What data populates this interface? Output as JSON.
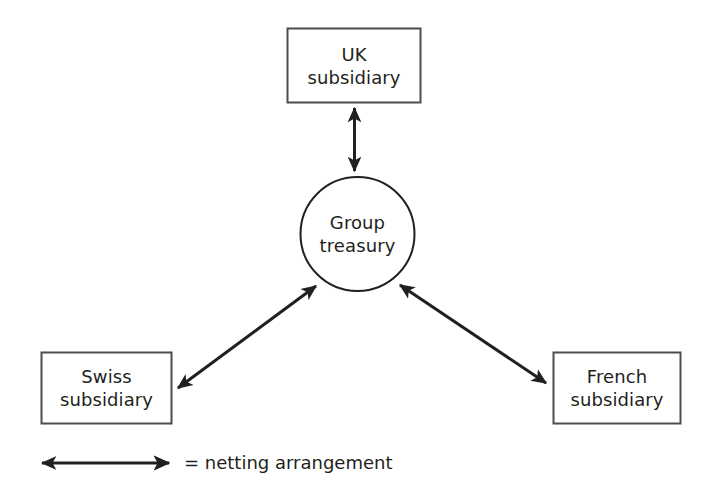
{
  "diagram": {
    "stroke_color": "#231f20",
    "fill_color": "#ffffff",
    "nodes": [
      {
        "id": "uk-subsidiary",
        "shape": "rectangle",
        "line1": "UK",
        "line2": "subsidiary"
      },
      {
        "id": "group-treasury",
        "shape": "circle",
        "line1": "Group",
        "line2": "treasury"
      },
      {
        "id": "swiss-subsidiary",
        "shape": "rectangle",
        "line1": "Swiss",
        "line2": "subsidiary"
      },
      {
        "id": "french-subsidiary",
        "shape": "rectangle",
        "line1": "French",
        "line2": "subsidiary"
      }
    ],
    "connectors": [
      {
        "id": "uk-treasury-connector",
        "from": "uk-subsidiary",
        "to": "group-treasury",
        "type": "double-headed-arrow",
        "meaning": "netting arrangement"
      },
      {
        "id": "swiss-treasury-connector",
        "from": "swiss-subsidiary",
        "to": "group-treasury",
        "type": "double-headed-arrow",
        "meaning": "netting arrangement"
      },
      {
        "id": "french-treasury-connector",
        "from": "french-subsidiary",
        "to": "group-treasury",
        "type": "double-headed-arrow",
        "meaning": "netting arrangement"
      }
    ]
  },
  "legend": {
    "symbol": "double-headed-arrow",
    "text": "= netting arrangement"
  }
}
